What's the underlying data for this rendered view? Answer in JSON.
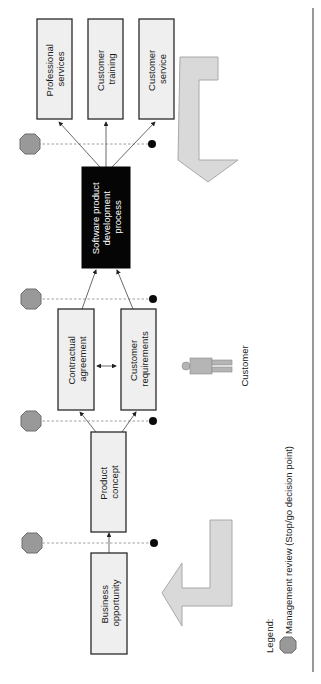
{
  "diagram": {
    "orientation": "rotated 90° counter-clockwise",
    "boxes": {
      "business_opportunity": [
        "Business",
        "opportunity"
      ],
      "product_concept": [
        "Product",
        "concept"
      ],
      "contractual_agreement": [
        "Contractual",
        "agreement"
      ],
      "customer_requirements": [
        "Customer",
        "requirements"
      ],
      "software_process": [
        "Software product",
        "development",
        "process"
      ],
      "professional_services": [
        "Professional",
        "services"
      ],
      "customer_training": [
        "Customer",
        "training"
      ],
      "customer_service": [
        "Customer",
        "service"
      ]
    },
    "actor": {
      "label": "Customer"
    },
    "legend": {
      "title": "Legend:",
      "item": "Management review (Stop/go decision point)"
    },
    "colors": {
      "box_fill": "#efefef",
      "dark_box_fill": "#050505",
      "octagon_fill": "#999999",
      "arrow_fill": "#d9d9d9"
    }
  }
}
